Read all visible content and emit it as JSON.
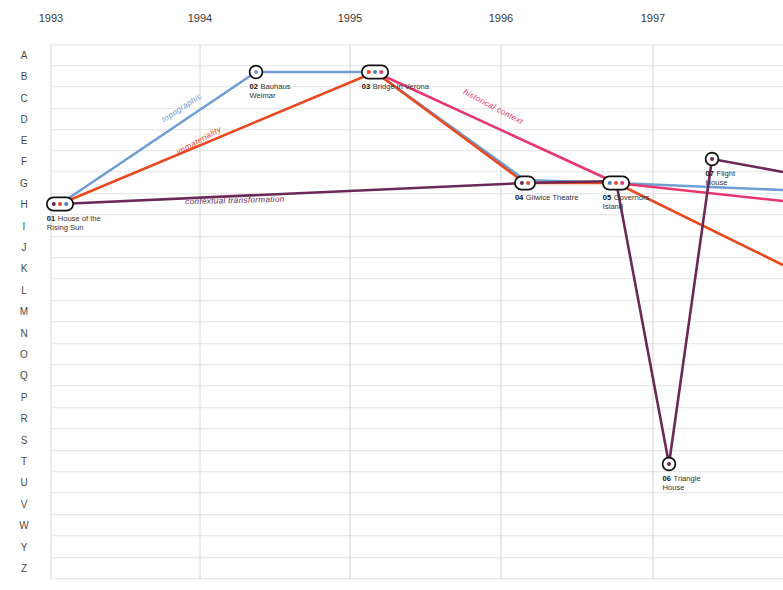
{
  "chart_data": {
    "type": "line",
    "title": "",
    "xlabel": "",
    "ylabel": "",
    "grid": true,
    "legend_position": "inline-along-paths",
    "x_axis": {
      "type": "category",
      "tick_labels": [
        "1993",
        "1994",
        "1995",
        "1996",
        "1997"
      ],
      "tick_x_px": [
        51,
        200,
        350,
        501,
        653
      ]
    },
    "y_axis": {
      "type": "category",
      "tick_labels": [
        "A",
        "B",
        "C",
        "D",
        "E",
        "F",
        "G",
        "H",
        "I",
        "J",
        "K",
        "L",
        "M",
        "N",
        "O",
        "Q",
        "P",
        "R",
        "S",
        "T",
        "U",
        "V",
        "W",
        "Y",
        "Z"
      ],
      "tick_y_px": [
        55,
        76,
        98,
        119,
        140,
        161,
        183,
        204,
        226,
        247,
        268,
        290,
        311,
        333,
        354,
        375,
        397,
        418,
        440,
        461,
        482,
        504,
        525,
        547,
        568
      ]
    },
    "nodes": [
      {
        "id": "01",
        "label": "House of the\nRising Sun",
        "label_line1": "House of the",
        "label_line2": "Rising Sun",
        "x": 1993.0,
        "y": "H",
        "px": 60,
        "py": 204,
        "shape": "pill",
        "dots": [
          "#6b2a56",
          "#e8491f",
          "#4a7fc1"
        ]
      },
      {
        "id": "02",
        "label": "Bauhaus\nWeimar",
        "label_line1": "Bauhaus",
        "label_line2": "Weimar",
        "x": 1994.35,
        "y": "B",
        "px": 256,
        "py": 72,
        "shape": "circle",
        "dots": [
          "#6f9ed4"
        ]
      },
      {
        "id": "03",
        "label": "Bridge in Verona",
        "label_line1": "Bridge in Verona",
        "label_line2": "",
        "x": 1995.05,
        "y": "B",
        "px": 375,
        "py": 72,
        "shape": "pill",
        "dots": [
          "#e8491f",
          "#4a7fc1",
          "#e8366f"
        ]
      },
      {
        "id": "04",
        "label": "Gliwice Theatre",
        "label_line1": "Gliwice Theatre",
        "label_line2": "",
        "x": 1996.15,
        "y": "G",
        "px": 525,
        "py": 183,
        "shape": "pill",
        "dots": [
          "#6b2a56",
          "#e8491f"
        ]
      },
      {
        "id": "05",
        "label": "Governors\nIsland",
        "label_line1": "Governors",
        "label_line2": "Island",
        "x": 1996.75,
        "y": "G",
        "px": 616,
        "py": 183,
        "shape": "pill",
        "dots": [
          "#4a7fc1",
          "#e8491f",
          "#e8366f"
        ]
      },
      {
        "id": "06",
        "label": "Triangle\nHouse",
        "label_line1": "Triangle",
        "label_line2": "House",
        "x": 1997.1,
        "y": "T",
        "px": 669,
        "py": 464,
        "shape": "circle",
        "dots": [
          "#6b2a56"
        ]
      },
      {
        "id": "07",
        "label": "Flight\nHouse",
        "label_line1": "Flight",
        "label_line2": "House",
        "x": 1997.4,
        "y": "F",
        "px": 712,
        "py": 159,
        "shape": "circle",
        "dots": [
          "#6b2a56"
        ]
      }
    ],
    "series": [
      {
        "name": "topographic",
        "color": "#6f9ed4",
        "label": "topographic",
        "label_px": [
          183,
          110
        ],
        "label_angle": -33,
        "points_px": [
          [
            60,
            204
          ],
          [
            256,
            72
          ],
          [
            375,
            72
          ],
          [
            525,
            180
          ],
          [
            616,
            183
          ],
          [
            783,
            190
          ]
        ]
      },
      {
        "name": "immateriality",
        "color": "#e8491f",
        "label": "immateriality",
        "label_px": [
          200,
          143
        ],
        "label_angle": -29,
        "points_px": [
          [
            60,
            204
          ],
          [
            375,
            72
          ],
          [
            525,
            183
          ],
          [
            616,
            183
          ],
          [
            783,
            265
          ]
        ]
      },
      {
        "name": "historical context",
        "color": "#e8366f",
        "label": "historical context",
        "label_px": [
          492,
          109
        ],
        "label_angle": 28,
        "points_px": [
          [
            375,
            72
          ],
          [
            616,
            183
          ],
          [
            783,
            201
          ]
        ]
      },
      {
        "name": "contextual transformation",
        "color": "#6b2a56",
        "label": "contextual transformation",
        "label_px": [
          235,
          203
        ],
        "label_angle": -1.5,
        "points_px": [
          [
            60,
            204
          ],
          [
            525,
            183
          ],
          [
            616,
            181
          ],
          [
            669,
            464
          ],
          [
            712,
            159
          ],
          [
            783,
            172
          ]
        ]
      }
    ]
  },
  "colors": {
    "topographic": "#6f9ed4",
    "immateriality": "#e8491f",
    "historical_context": "#e8366f",
    "contextual_transformation": "#6b2a56",
    "grid_horizontal": "#d8d8d8",
    "grid_vertical": "#c9c9c9",
    "node_stroke": "#111111",
    "node_fill": "#ffffff",
    "text": "#333333",
    "background": "#ffffff"
  }
}
